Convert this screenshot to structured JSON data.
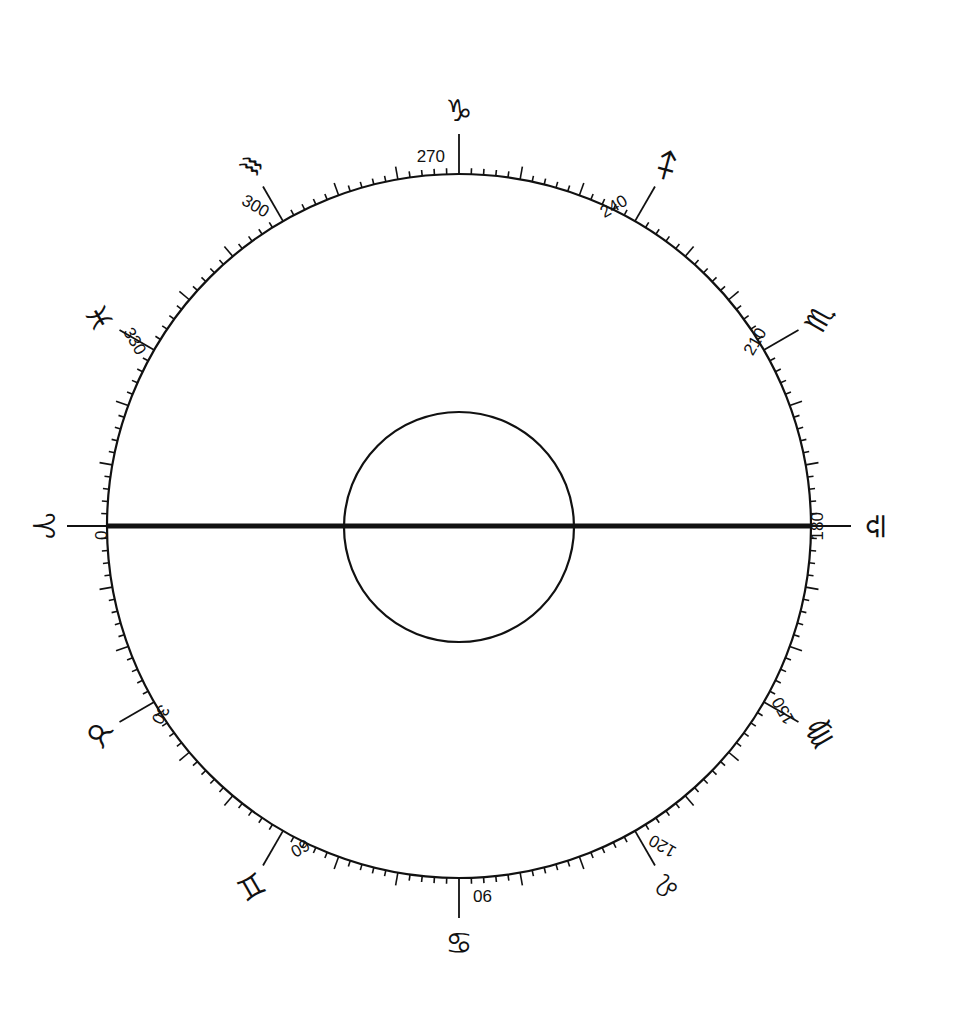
{
  "diagram": {
    "type": "ecliptic-longitude-dial",
    "outer_circle": {
      "cx": 459,
      "cy": 526,
      "r": 352
    },
    "inner_circle": {
      "cx": 459,
      "cy": 527,
      "r": 115
    },
    "equinox_line": {
      "from_deg": 0,
      "to_deg": 180,
      "label": "0°–180° line"
    },
    "scale": {
      "minor_step_deg": 2,
      "medium_step_deg": 10,
      "major_step_deg": 30,
      "zero_position": "left",
      "direction": "counterclockwise"
    },
    "major_marks": [
      {
        "deg": 0,
        "label": "0",
        "sign": "♈",
        "sign_name": "Aries"
      },
      {
        "deg": 30,
        "label": "30",
        "sign": "♉",
        "sign_name": "Taurus"
      },
      {
        "deg": 60,
        "label": "60",
        "sign": "♊",
        "sign_name": "Gemini"
      },
      {
        "deg": 90,
        "label": "90",
        "sign": "♋",
        "sign_name": "Cancer"
      },
      {
        "deg": 120,
        "label": "120",
        "sign": "♌",
        "sign_name": "Leo"
      },
      {
        "deg": 150,
        "label": "150",
        "sign": "♍",
        "sign_name": "Virgo"
      },
      {
        "deg": 180,
        "label": "180",
        "sign": "♎",
        "sign_name": "Libra"
      },
      {
        "deg": 210,
        "label": "210",
        "sign": "♏",
        "sign_name": "Scorpio"
      },
      {
        "deg": 240,
        "label": "240",
        "sign": "♐",
        "sign_name": "Sagittarius"
      },
      {
        "deg": 270,
        "label": "270",
        "sign": "♑",
        "sign_name": "Capricorn"
      },
      {
        "deg": 300,
        "label": "300",
        "sign": "♒",
        "sign_name": "Aquarius"
      },
      {
        "deg": 330,
        "label": "330",
        "sign": "♓",
        "sign_name": "Pisces"
      }
    ]
  }
}
